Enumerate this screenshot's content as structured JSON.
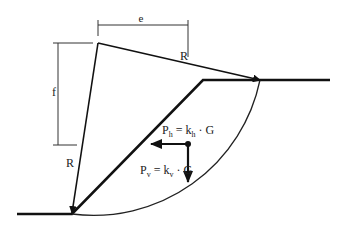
{
  "diagram": {
    "title": "",
    "labels": {
      "e": "e",
      "f": "f",
      "radius_top": "R",
      "radius_left": "R",
      "ph": {
        "base": "P",
        "sub": "h",
        "eq": " = k",
        "sub2": "h",
        "tail": " · G"
      },
      "pv": {
        "base": "P",
        "sub": "v",
        "eq": " = k",
        "sub2": "v",
        "tail": " · G"
      }
    },
    "elements": [
      "slope-profile",
      "slip-circle-arc",
      "radius-line-to-crest",
      "radius-line-to-toe",
      "dimension-e",
      "dimension-f",
      "horizontal-seismic-force-arrow",
      "vertical-seismic-force-arrow"
    ],
    "colors": {
      "line": "#111111",
      "thin": "#333333",
      "text": "#222222"
    }
  }
}
